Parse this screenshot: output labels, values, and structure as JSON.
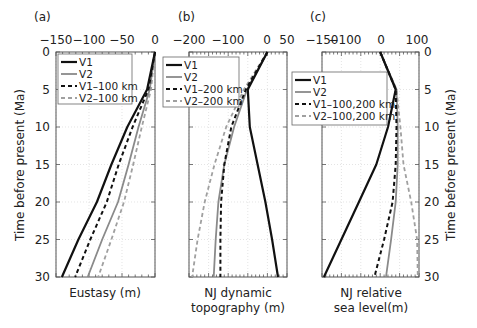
{
  "chart_data": [
    {
      "type": "line",
      "panel_label": "(a)",
      "xlabel": "Eustasy (m)",
      "ylabel": "Time before present (Ma)",
      "xlim": [
        -150,
        0
      ],
      "ylim": [
        30,
        0
      ],
      "x_ticks": [
        "-150",
        "-100",
        "-50",
        "0"
      ],
      "y_ticks": [
        "0",
        "5",
        "10",
        "15",
        "20",
        "25",
        "30"
      ],
      "grid": true,
      "legend_position": "upper-left",
      "time": [
        0,
        5,
        10,
        15,
        20,
        25,
        30
      ],
      "series": [
        {
          "name": "V1",
          "style": "solid-black",
          "values": [
            0,
            -12,
            -42,
            -66,
            -88,
            -116,
            -141
          ]
        },
        {
          "name": "V2",
          "style": "solid-gray",
          "values": [
            0,
            -8,
            -25,
            -40,
            -56,
            -80,
            -102
          ]
        },
        {
          "name": "V1–100 km",
          "style": "dashed-black",
          "values": [
            0,
            -10,
            -34,
            -55,
            -73,
            -98,
            -121
          ]
        },
        {
          "name": "V2–100 km",
          "style": "dashed-gray",
          "values": [
            0,
            -6,
            -20,
            -33,
            -47,
            -66,
            -86
          ]
        }
      ]
    },
    {
      "type": "line",
      "panel_label": "(b)",
      "xlabel": "NJ dynamic topography (m)",
      "xlim": [
        -200,
        50
      ],
      "ylim": [
        30,
        0
      ],
      "x_ticks": [
        "-200",
        "-100",
        "0",
        "50"
      ],
      "grid": true,
      "legend_position": "upper-left",
      "time": [
        0,
        5,
        10,
        15,
        20,
        25,
        30
      ],
      "series": [
        {
          "name": "V1",
          "style": "solid-black",
          "values": [
            0,
            -50,
            -45,
            -25,
            -5,
            12,
            27
          ]
        },
        {
          "name": "V2",
          "style": "solid-gray",
          "values": [
            0,
            -52,
            -85,
            -110,
            -125,
            -132,
            -137
          ]
        },
        {
          "name": "V1–200 km",
          "style": "dashed-black",
          "values": [
            0,
            -55,
            -92,
            -110,
            -118,
            -120,
            -120
          ]
        },
        {
          "name": "V2–200 km",
          "style": "dashed-gray",
          "values": [
            0,
            -60,
            -105,
            -135,
            -160,
            -178,
            -192
          ]
        }
      ]
    },
    {
      "type": "line",
      "panel_label": "(c)",
      "xlabel": "NJ relative sea level(m)",
      "ylabel": "Time before present (Ma)",
      "xlim": [
        -150,
        100
      ],
      "ylim": [
        30,
        0
      ],
      "x_ticks": [
        "-150",
        "-100",
        "0",
        "100"
      ],
      "y_ticks": [
        "0",
        "5",
        "10",
        "15",
        "20",
        "25",
        "30"
      ],
      "grid": true,
      "legend_position": "middle-left",
      "time": [
        0,
        5,
        10,
        15,
        20,
        25,
        30
      ],
      "series": [
        {
          "name": "V1",
          "style": "solid-black",
          "values": [
            0,
            40,
            20,
            -10,
            -55,
            -100,
            -145
          ]
        },
        {
          "name": "V2",
          "style": "solid-gray",
          "values": [
            0,
            42,
            45,
            45,
            40,
            28,
            15
          ]
        },
        {
          "name": "V1–100,200 km",
          "style": "dashed-black",
          "values": [
            0,
            40,
            42,
            40,
            32,
            10,
            -15
          ]
        },
        {
          "name": "V2–100,200 km",
          "style": "dashed-gray",
          "values": [
            0,
            42,
            52,
            60,
            80,
            95,
            97
          ]
        }
      ]
    }
  ],
  "labels": {
    "panel_a": "(a)",
    "panel_b": "(b)",
    "panel_c": "(c)",
    "xlabel_a": "Eustasy (m)",
    "xlabel_b_line1": "NJ dynamic",
    "xlabel_b_line2": "topography (m)",
    "xlabel_c_line1": "NJ relative",
    "xlabel_c_line2": "sea level(m)",
    "ylabel_left": "Time before present (Ma)",
    "ylabel_right": "Time before present (Ma)",
    "ticks_a": [
      "−150",
      "−100",
      "−50",
      "0"
    ],
    "ticks_b": [
      "−200",
      "−100",
      "0",
      "50"
    ],
    "ticks_c": [
      "−150",
      "−100",
      "0",
      "100"
    ],
    "yticks": [
      "0",
      "5",
      "10",
      "15",
      "20",
      "25",
      "30"
    ],
    "legend_a": [
      "V1",
      "V2",
      "V1–100 km",
      "V2–100 km"
    ],
    "legend_b": [
      "V1",
      "V2",
      "V1–200 km",
      "V2–200 km"
    ],
    "legend_c": [
      "V1",
      "V2",
      "V1–100,200 km",
      "V2–100,200 km"
    ]
  },
  "colors": {
    "v1": "#111111",
    "v2": "#8a8a8a",
    "v1_dashed": "#111111",
    "v2_dashed": "#a0a0a0",
    "grid": "#d8d8d8",
    "axis": "#555555"
  }
}
